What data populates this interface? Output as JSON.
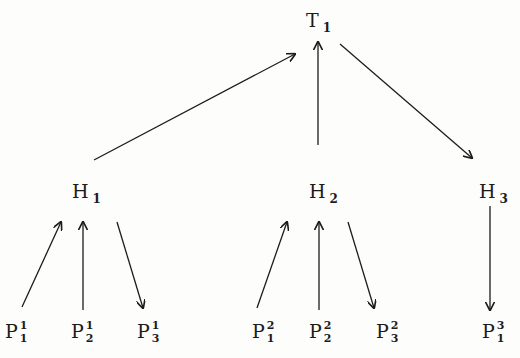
{
  "diagram": {
    "type": "tree",
    "colors": {
      "background": "#fdfdfb",
      "ink": "#1c1c1c"
    },
    "nodes": {
      "T1": {
        "base": "T",
        "sub": "1"
      },
      "H1": {
        "base": "H",
        "sub": "1"
      },
      "H2": {
        "base": "H",
        "sub": "2"
      },
      "H3": {
        "base": "H",
        "sub": "3"
      },
      "P11": {
        "base": "P",
        "sup": "1",
        "sub": "1"
      },
      "P12": {
        "base": "P",
        "sup": "1",
        "sub": "2"
      },
      "P13": {
        "base": "P",
        "sup": "1",
        "sub": "3"
      },
      "P21": {
        "base": "P",
        "sup": "2",
        "sub": "1"
      },
      "P22": {
        "base": "P",
        "sup": "2",
        "sub": "2"
      },
      "P23": {
        "base": "P",
        "sup": "2",
        "sub": "3"
      },
      "P31": {
        "base": "P",
        "sup": "3",
        "sub": "1"
      }
    },
    "edges": [
      {
        "from": "H1",
        "to": "T1",
        "direction": "up"
      },
      {
        "from": "H2",
        "to": "T1",
        "direction": "up"
      },
      {
        "from": "T1",
        "to": "H3",
        "direction": "down"
      },
      {
        "from": "P11",
        "to": "H1",
        "direction": "up"
      },
      {
        "from": "P12",
        "to": "H1",
        "direction": "up"
      },
      {
        "from": "H1",
        "to": "P13",
        "direction": "down"
      },
      {
        "from": "P21",
        "to": "H2",
        "direction": "up"
      },
      {
        "from": "P22",
        "to": "H2",
        "direction": "up"
      },
      {
        "from": "H2",
        "to": "P23",
        "direction": "down"
      },
      {
        "from": "H3",
        "to": "P31",
        "direction": "down"
      }
    ]
  }
}
